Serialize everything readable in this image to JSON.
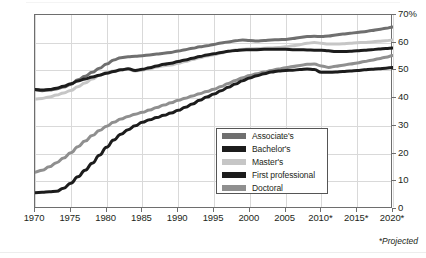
{
  "footnote": "*Projected",
  "axes": {
    "y_ticks": [
      "0",
      "10",
      "20",
      "30",
      "40",
      "50",
      "60",
      "70%"
    ],
    "x_ticks": [
      "1970",
      "1975",
      "1980",
      "1985",
      "1990",
      "1995",
      "2000",
      "2005",
      "2010*",
      "2015*",
      "2020*"
    ]
  },
  "legend": {
    "items": [
      {
        "label": "Associate's",
        "color": "#6f6f6f"
      },
      {
        "label": "Bachelor's",
        "color": "#1c1c1c"
      },
      {
        "label": "Master's",
        "color": "#c6c6c6"
      },
      {
        "label": "First professional",
        "color": "#1c1c1c"
      },
      {
        "label": "Doctoral",
        "color": "#8f8f8f"
      }
    ]
  },
  "chart_data": {
    "type": "line",
    "title": "",
    "xlabel": "",
    "ylabel": "",
    "xlim": [
      1970,
      2020
    ],
    "ylim": [
      0,
      70
    ],
    "grid": true,
    "legend_position": "center-right",
    "annotations": [
      "*Projected"
    ],
    "x": [
      1970,
      1971,
      1972,
      1973,
      1974,
      1975,
      1976,
      1977,
      1978,
      1979,
      1980,
      1981,
      1982,
      1983,
      1984,
      1985,
      1986,
      1987,
      1988,
      1989,
      1990,
      1991,
      1992,
      1993,
      1994,
      1995,
      1996,
      1997,
      1998,
      1999,
      2000,
      2001,
      2002,
      2003,
      2004,
      2005,
      2006,
      2007,
      2008,
      2009,
      2010,
      2011,
      2012,
      2013,
      2014,
      2015,
      2016,
      2017,
      2018,
      2019,
      2020
    ],
    "series": [
      {
        "name": "Associate's",
        "color": "#6f6f6f",
        "values": [
          43.0,
          42.7,
          42.9,
          43.3,
          44.0,
          44.9,
          46.6,
          47.9,
          49.3,
          50.8,
          52.3,
          53.8,
          54.6,
          54.9,
          55.1,
          55.3,
          55.6,
          55.9,
          56.2,
          56.5,
          57.0,
          57.5,
          58.0,
          58.5,
          58.9,
          59.4,
          59.9,
          60.3,
          60.7,
          61.0,
          60.8,
          60.6,
          60.8,
          61.0,
          61.1,
          61.2,
          61.5,
          61.9,
          62.2,
          62.3,
          62.2,
          62.4,
          62.8,
          63.1,
          63.4,
          63.7,
          64.0,
          64.4,
          64.8,
          65.2,
          65.7
        ]
      },
      {
        "name": "Master's",
        "color": "#c6c6c6",
        "values": [
          39.7,
          39.9,
          40.4,
          41.1,
          41.9,
          42.8,
          44.1,
          45.5,
          46.9,
          48.2,
          49.3,
          49.8,
          50.2,
          50.4,
          49.8,
          50.1,
          50.6,
          51.2,
          51.7,
          52.0,
          52.6,
          53.2,
          53.9,
          54.6,
          55.2,
          55.7,
          56.3,
          56.9,
          57.4,
          57.6,
          57.8,
          57.9,
          58.0,
          58.1,
          58.3,
          58.5,
          58.9,
          59.3,
          59.8,
          60.1,
          59.8,
          59.5,
          59.5,
          59.6,
          59.8,
          60.0,
          60.1,
          60.3,
          60.5,
          60.7,
          61.0
        ]
      },
      {
        "name": "Bachelor's",
        "color": "#1c1c1c",
        "values": [
          43.1,
          42.9,
          43.1,
          43.6,
          44.3,
          45.2,
          46.2,
          46.9,
          47.6,
          48.3,
          49.0,
          49.6,
          50.2,
          50.6,
          50.0,
          50.4,
          51.0,
          51.6,
          52.2,
          52.6,
          53.2,
          53.8,
          54.4,
          55.0,
          55.6,
          56.0,
          56.5,
          56.9,
          57.2,
          57.4,
          57.5,
          57.5,
          57.6,
          57.6,
          57.6,
          57.6,
          57.5,
          57.5,
          57.4,
          57.3,
          57.3,
          57.1,
          56.8,
          56.8,
          56.9,
          57.1,
          57.3,
          57.5,
          57.7,
          57.9,
          58.1
        ]
      },
      {
        "name": "Doctoral",
        "color": "#8f8f8f",
        "values": [
          13.3,
          14.0,
          15.2,
          16.7,
          18.4,
          20.3,
          22.5,
          24.5,
          26.5,
          28.3,
          29.9,
          31.3,
          32.5,
          33.4,
          34.2,
          34.9,
          35.7,
          36.6,
          37.5,
          38.3,
          39.2,
          40.0,
          40.8,
          41.6,
          42.4,
          43.2,
          44.2,
          45.3,
          46.4,
          47.4,
          48.2,
          48.8,
          49.4,
          50.0,
          50.5,
          51.0,
          51.4,
          51.8,
          52.2,
          52.3,
          51.6,
          51.1,
          51.5,
          51.9,
          52.3,
          52.7,
          53.2,
          53.7,
          54.2,
          54.8,
          55.4
        ]
      },
      {
        "name": "First professional",
        "color": "#1c1c1c",
        "values": [
          5.9,
          6.0,
          6.2,
          6.4,
          7.5,
          9.3,
          11.6,
          14.0,
          16.5,
          19.4,
          22.3,
          24.9,
          27.0,
          28.6,
          30.0,
          31.3,
          32.2,
          33.0,
          33.8,
          34.6,
          35.6,
          36.7,
          37.9,
          39.2,
          40.4,
          41.5,
          42.7,
          43.9,
          45.1,
          46.3,
          47.3,
          48.1,
          48.8,
          49.4,
          49.8,
          50.0,
          50.1,
          50.3,
          50.5,
          50.3,
          49.3,
          49.3,
          49.4,
          49.6,
          49.8,
          50.0,
          50.2,
          50.4,
          50.6,
          50.8,
          51.1
        ]
      }
    ]
  }
}
